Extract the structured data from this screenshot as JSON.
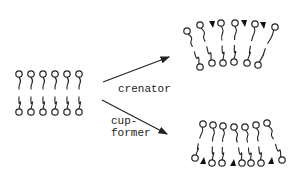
{
  "diagram": {
    "type": "lipid-bilayer-shape-change",
    "labels": {
      "crenator": "crenator",
      "cupformer_line1": "cup-",
      "cupformer_line2": "former"
    },
    "colors": {
      "stroke": "#222222",
      "background": "#ffffff",
      "wedge": "#111111"
    },
    "initial_bilayer": {
      "top_heads": [
        [
          19,
          74
        ],
        [
          31,
          74
        ],
        [
          43,
          74
        ],
        [
          55,
          74
        ],
        [
          67,
          74
        ],
        [
          79,
          74
        ]
      ],
      "bottom_heads": [
        [
          19,
          112
        ],
        [
          31,
          112
        ],
        [
          43,
          112
        ],
        [
          55,
          112
        ],
        [
          67,
          112
        ],
        [
          79,
          112
        ]
      ]
    },
    "arrows": [
      {
        "name": "crenator-arrow",
        "from": [
          103,
          82
        ],
        "to": [
          169,
          57
        ]
      },
      {
        "name": "cupformer-arrow",
        "from": [
          102,
          100
        ],
        "to": [
          167,
          134
        ]
      }
    ],
    "crenated_bilayer": {
      "top_heads": [
        [
          187,
          31
        ],
        [
          200,
          25
        ],
        [
          221,
          23
        ],
        [
          235,
          23
        ],
        [
          255,
          24
        ],
        [
          275,
          27
        ]
      ],
      "bottom_heads": [
        [
          200,
          67
        ],
        [
          212,
          63
        ],
        [
          223,
          63
        ],
        [
          234,
          62
        ],
        [
          247,
          63
        ],
        [
          258,
          65
        ]
      ],
      "wedges": [
        [
          212,
          24
        ],
        [
          244,
          23
        ],
        [
          263,
          25
        ]
      ],
      "wedge_direction": "down"
    },
    "cupped_bilayer": {
      "top_heads": [
        [
          203,
          124
        ],
        [
          213,
          125
        ],
        [
          223,
          126
        ],
        [
          234,
          127
        ],
        [
          245,
          127
        ],
        [
          256,
          125
        ],
        [
          267,
          123
        ]
      ],
      "bottom_heads": [
        [
          195,
          158
        ],
        [
          212,
          163
        ],
        [
          222,
          163
        ],
        [
          242,
          163
        ],
        [
          251,
          163
        ],
        [
          261,
          163
        ],
        [
          282,
          160
        ]
      ],
      "wedges": [
        [
          203,
          161
        ],
        [
          233,
          163
        ],
        [
          271,
          161
        ]
      ],
      "wedge_direction": "up"
    }
  }
}
